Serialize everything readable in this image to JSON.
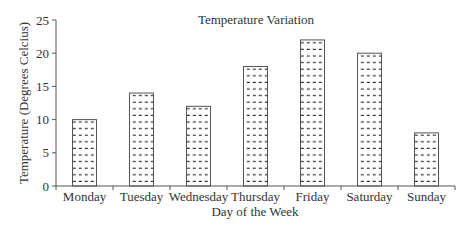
{
  "chart_data": {
    "type": "bar",
    "title": "Temperature Variation",
    "xlabel": "Day of the Week",
    "ylabel": "Temperature (Degrees Celcius)",
    "categories": [
      "Monday",
      "Tuesday",
      "Wednesday",
      "Thursday",
      "Friday",
      "Saturday",
      "Sunday"
    ],
    "values": [
      10,
      14,
      12,
      18,
      22,
      20,
      8
    ],
    "ylim": [
      0,
      25
    ],
    "yticks": [
      0,
      5,
      10,
      15,
      20,
      25
    ],
    "grid": false,
    "legend": null,
    "bar_fill": "dotted-dash pattern",
    "colors": {
      "axis": "#555555",
      "bar_outline": "#555555",
      "pattern": "#333333",
      "text": "#333333"
    }
  }
}
